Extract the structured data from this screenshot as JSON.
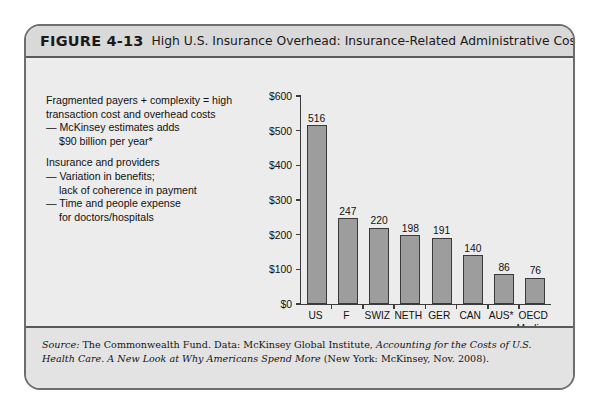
{
  "figure": {
    "label": "FIGURE 4-13",
    "title": "High U.S. Insurance Overhead: Insurance-Related Administrative Costs."
  },
  "narrative": {
    "p1_l1": "Fragmented payers + complexity = high",
    "p1_l2": "transaction cost and overhead costs",
    "p1_l3": "— McKinsey estimates adds",
    "p1_l4": "$90 billion per year*",
    "p2_l1": "Insurance and providers",
    "p2_l2": "— Variation in benefits;",
    "p2_l3": "lack of coherence in payment",
    "p2_l4": "— Time and people expense",
    "p2_l5": "for doctors/hospitals"
  },
  "footnote": "* 2006",
  "source": {
    "prefix_italic": "Source:",
    "seg1": " The Commonwealth Fund. Data: McKinsey Global Institute, ",
    "title_italic": "Accounting for the Costs of U.S. Health Care. A New Look at Why Americans Spend More",
    "seg2": " (New York: McKinsey, Nov. 2008)."
  },
  "colors": {
    "bar_fill": "#9d9d9d",
    "bar_stroke": "#3a3a3a",
    "card_bg": "#efefef",
    "header_bg": "#d9d9d9",
    "frame": "#6d6d6d"
  },
  "chart_data": {
    "type": "bar",
    "title": "High U.S. Insurance Overhead: Insurance-Related Administrative Costs.",
    "xlabel": "",
    "ylabel": "",
    "ylim": [
      0,
      600
    ],
    "grid": false,
    "legend": "none",
    "ytick_labels": [
      "$600",
      "$500",
      "$400",
      "$300",
      "$200",
      "$100",
      "$0"
    ],
    "ytick_values": [
      600,
      500,
      400,
      300,
      200,
      100,
      0
    ],
    "categories": [
      "US",
      "F",
      "SWIZ",
      "NETH",
      "GER",
      "CAN",
      "AUS*",
      "OECD Median"
    ],
    "category_lines": [
      [
        "US",
        ""
      ],
      [
        "F",
        ""
      ],
      [
        "SWIZ",
        ""
      ],
      [
        "NETH",
        ""
      ],
      [
        "GER",
        ""
      ],
      [
        "CAN",
        ""
      ],
      [
        "AUS*",
        ""
      ],
      [
        "OECD",
        "Median"
      ]
    ],
    "values": [
      516,
      247,
      220,
      198,
      191,
      140,
      86,
      76
    ],
    "value_labels": [
      "516",
      "247",
      "220",
      "198",
      "191",
      "140",
      "86",
      "76"
    ],
    "annotations": [
      "* 2006"
    ]
  }
}
